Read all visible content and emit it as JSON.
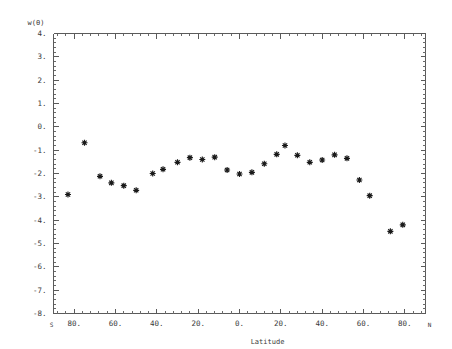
{
  "chart_data": {
    "type": "scatter",
    "title": "",
    "xlabel": "Latitude",
    "ylabel": "w(θ)",
    "xlim": [
      -90,
      90
    ],
    "ylim": [
      -8,
      4
    ],
    "grid": false,
    "legend": null,
    "x_axis": {
      "left_end_label": "S",
      "right_end_label": "N",
      "tick_labels": [
        "80.",
        "60.",
        "40.",
        "20.",
        "0.",
        "20.",
        "40.",
        "60.",
        "80."
      ],
      "tick_values": [
        -80,
        -60,
        -40,
        -20,
        0,
        20,
        40,
        60,
        80
      ],
      "minor_ticks_per_interval": 4
    },
    "y_axis": {
      "tick_labels": [
        "4.",
        "3.",
        "2.",
        "1.",
        "0.",
        "-1.",
        "-2.",
        "-3.",
        "-4.",
        "-5.",
        "-6.",
        "-7.",
        "-8."
      ],
      "tick_values": [
        4,
        3,
        2,
        1,
        0,
        -1,
        -2,
        -3,
        -4,
        -5,
        -6,
        -7,
        -8
      ],
      "minor_ticks_per_interval": 4
    },
    "marker": {
      "style": "asterisk-box",
      "color": "#1a1a1a",
      "size": 6
    },
    "points": [
      {
        "x": -83.0,
        "y": -2.9
      },
      {
        "x": -75.0,
        "y": -0.68
      },
      {
        "x": -67.5,
        "y": -2.12
      },
      {
        "x": -62.0,
        "y": -2.4
      },
      {
        "x": -56.0,
        "y": -2.52
      },
      {
        "x": -50.0,
        "y": -2.72
      },
      {
        "x": -42.0,
        "y": -2.0
      },
      {
        "x": -37.0,
        "y": -1.82
      },
      {
        "x": -30.0,
        "y": -1.52
      },
      {
        "x": -24.0,
        "y": -1.32
      },
      {
        "x": -18.0,
        "y": -1.4
      },
      {
        "x": -12.0,
        "y": -1.3
      },
      {
        "x": -6.0,
        "y": -1.85
      },
      {
        "x": 0.0,
        "y": -2.02
      },
      {
        "x": 6.0,
        "y": -1.95
      },
      {
        "x": 12.0,
        "y": -1.58
      },
      {
        "x": 18.0,
        "y": -1.18
      },
      {
        "x": 22.0,
        "y": -0.8
      },
      {
        "x": 28.0,
        "y": -1.22
      },
      {
        "x": 34.0,
        "y": -1.52
      },
      {
        "x": 40.0,
        "y": -1.42
      },
      {
        "x": 46.0,
        "y": -1.2
      },
      {
        "x": 52.0,
        "y": -1.35
      },
      {
        "x": 58.0,
        "y": -2.28
      },
      {
        "x": 63.0,
        "y": -2.95
      },
      {
        "x": 73.0,
        "y": -4.48
      },
      {
        "x": 79.0,
        "y": -4.2
      }
    ]
  }
}
